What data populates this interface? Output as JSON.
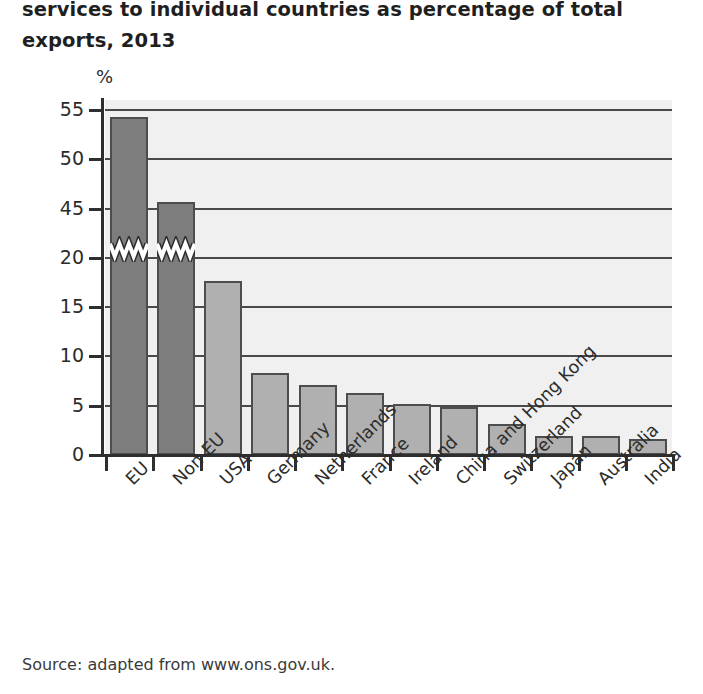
{
  "figure": {
    "title_lines": [
      "services to individual countries as percentage of total",
      "exports, 2013"
    ],
    "source": "Source: adapted from www.ons.gov.uk."
  },
  "chart_data": {
    "type": "bar",
    "title": "services to individual countries as percentage of total exports, 2013",
    "xlabel": "",
    "ylabel": "%",
    "categories": [
      "EU",
      "Non-EU",
      "USA",
      "Germany",
      "Netherlands",
      "France",
      "Ireland",
      "China and Hong Kong",
      "Switzerland",
      "Japan",
      "Australia",
      "India"
    ],
    "values": [
      54.3,
      45.7,
      17.6,
      8.3,
      7.1,
      6.3,
      5.2,
      4.9,
      3.1,
      1.9,
      1.9,
      1.6
    ],
    "bar_styles": [
      "dark",
      "dark",
      "light",
      "light",
      "light",
      "light",
      "light",
      "light",
      "light",
      "light",
      "light",
      "light"
    ],
    "ytick_labels": [
      "0",
      "5",
      "10",
      "15",
      "20",
      "45",
      "50",
      "55"
    ],
    "ytick_values": [
      0,
      5,
      10,
      15,
      20,
      45,
      50,
      55
    ],
    "axis_break": {
      "present": true,
      "between": [
        20,
        45
      ],
      "note": "y-axis broken between 20% and 45%; zigzag marks drawn across the EU and Non-EU bars"
    },
    "grid": "horizontal",
    "legend": "none",
    "colors": {
      "bar_dark": "#7d7d7d",
      "bar_light": "#b0b0b0",
      "bar_outline": "#4d4d4d",
      "plot_background": "#f0f0f0",
      "gridline": "#4a4a4a",
      "axis": "#2e2e2e",
      "text": "#2b2b2b"
    }
  }
}
